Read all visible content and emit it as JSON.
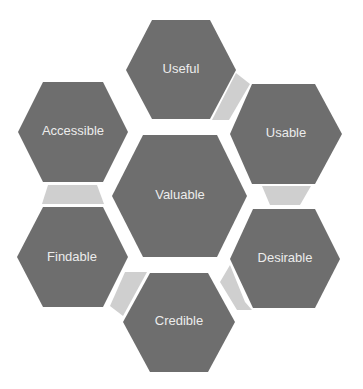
{
  "diagram": {
    "colors": {
      "hexagon": "#6e6e6e",
      "connector": "#cfcfcf",
      "text": "#ececec",
      "background": "#ffffff"
    },
    "center": {
      "label": "Valuable"
    },
    "facets": [
      {
        "id": "useful",
        "label": "Useful"
      },
      {
        "id": "usable",
        "label": "Usable"
      },
      {
        "id": "desirable",
        "label": "Desirable"
      },
      {
        "id": "credible",
        "label": "Credible"
      },
      {
        "id": "findable",
        "label": "Findable"
      },
      {
        "id": "accessible",
        "label": "Accessible"
      }
    ]
  }
}
